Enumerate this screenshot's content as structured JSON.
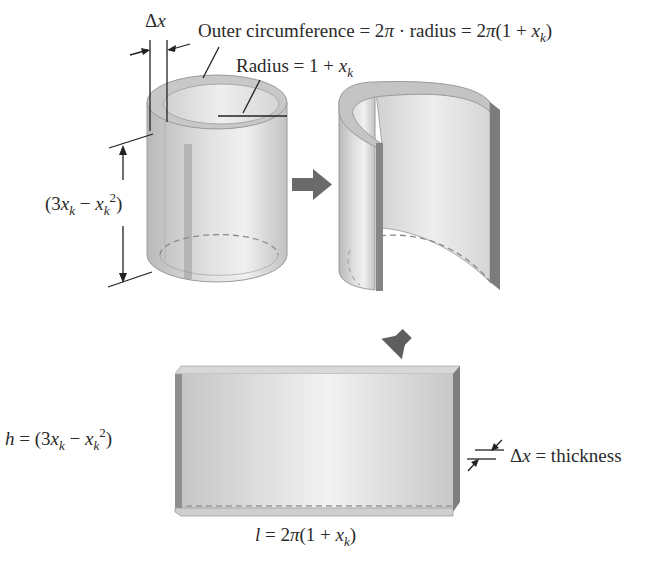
{
  "figure": {
    "colors": {
      "shell_light": "#e8e8e8",
      "shell_mid": "#c4c4c4",
      "shell_dark": "#8a8a8a",
      "arrow": "#666666",
      "text": "#2a2a2a"
    },
    "labels": {
      "delta_x": {
        "symbol": "Δ",
        "var": "x"
      },
      "outer_circumference": {
        "prefix": "Outer circumference = 2",
        "pi": "π",
        "middle": " · radius = 2",
        "pi2": "π",
        "open": "(1 + ",
        "var": "x",
        "sub": "k",
        "close": ")"
      },
      "radius": {
        "prefix": "Radius = 1 + ",
        "var": "x",
        "sub": "k"
      },
      "shell_height": {
        "open": "(3",
        "var1": "x",
        "sub1": "k",
        "minus": " − ",
        "var2": "x",
        "sub2": "k",
        "sup": "2",
        "close": ")"
      },
      "slab_height": {
        "h": "h",
        "eq": " = (3",
        "var1": "x",
        "sub1": "k",
        "minus": " − ",
        "var2": "x",
        "sub2": "k",
        "sup": "2",
        "close": ")"
      },
      "thickness": {
        "symbol": "Δ",
        "var": "x",
        "rest": " = thickness"
      },
      "slab_length": {
        "l": "l",
        "eq": " = 2",
        "pi": "π",
        "open": "(1 + ",
        "var": "x",
        "sub": "k",
        "close": ")"
      }
    },
    "arrows": [
      {
        "name": "right-arrow",
        "meaning": "cylinder cut open"
      },
      {
        "name": "down-left-arrow",
        "meaning": "shell flattened into slab"
      }
    ]
  }
}
